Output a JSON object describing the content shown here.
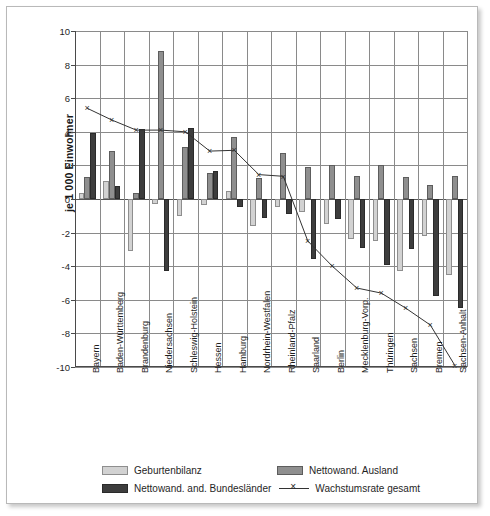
{
  "chart_data": {
    "type": "bar",
    "title": "",
    "subtitle": "",
    "xlabel": "",
    "ylabel": "je 1 000 Einwohner",
    "ylim": [
      -10,
      10
    ],
    "ytick_values": [
      10,
      8,
      6,
      4,
      2,
      0,
      -2,
      -4,
      -6,
      -8,
      -10
    ],
    "ytick_labels": [
      "10",
      "8",
      "6",
      "4",
      "2",
      "0",
      "-2",
      "-4",
      "-6",
      "-8",
      "-10"
    ],
    "grid": true,
    "legend_position": "bottom",
    "categories": [
      "Bayern",
      "Baden-Württemberg",
      "Brandenburg",
      "Niedersachsen",
      "Schleswig-Holstein",
      "Hessen",
      "Hamburg",
      "Nordrhein-Westfalen",
      "Rheinland-Pfalz",
      "Saarland",
      "Berlin",
      "Mecklenburg-Vorp.",
      "Thüringen",
      "Sachsen",
      "Bremen",
      "Sachsen-Anhalt"
    ],
    "series": [
      {
        "name": "Geburtenbilanz",
        "type": "bar",
        "color": "#d2d2d2",
        "values": [
          0.35,
          1.1,
          -3.1,
          -0.3,
          -1.0,
          -0.35,
          0.5,
          -1.6,
          -0.5,
          -0.8,
          -1.5,
          -2.4,
          -2.5,
          -4.3,
          -2.2,
          -4.5
        ]
      },
      {
        "name": "Nettowand. Ausland",
        "type": "bar",
        "color": "#8f8f8f",
        "values": [
          1.3,
          2.85,
          0.35,
          8.8,
          3.1,
          1.55,
          3.7,
          1.25,
          2.75,
          1.9,
          2.0,
          1.35,
          2.0,
          1.3,
          0.85,
          1.35
        ]
      },
      {
        "name": "Nettowand. and. Bundesländer",
        "type": "bar",
        "color": "#3d3d3d",
        "values": [
          3.9,
          0.8,
          4.15,
          -4.3,
          4.2,
          1.65,
          -0.5,
          -1.15,
          -0.9,
          -3.6,
          -1.2,
          -2.9,
          -3.9,
          -3.0,
          -5.8,
          -6.5
        ]
      },
      {
        "name": "Wachstumsrate gesamt",
        "type": "line",
        "marker": "x",
        "color": "#333333",
        "values": [
          5.4,
          4.7,
          4.1,
          4.1,
          4.0,
          2.85,
          2.9,
          1.45,
          1.35,
          -2.5,
          -4.0,
          -5.3,
          -5.6,
          -6.5,
          -7.5,
          -9.9
        ]
      }
    ]
  },
  "legend": {
    "items": [
      {
        "label": "Geburtenbilanz",
        "swatch": "geb"
      },
      {
        "label": "Nettowand. Ausland",
        "swatch": "aus"
      },
      {
        "label": "Nettowand. and. Bundesländer",
        "swatch": "bun"
      },
      {
        "label": "Wachstumsrate gesamt",
        "swatch": "line"
      }
    ]
  }
}
